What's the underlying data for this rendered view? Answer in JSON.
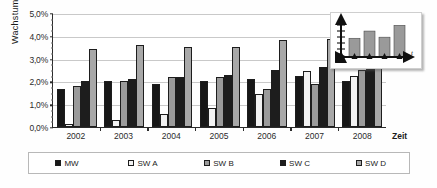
{
  "chart_data": {
    "type": "bar",
    "title": "",
    "xlabel": "Zeit",
    "ylabel": "Wachstum",
    "categories": [
      "2002",
      "2003",
      "2004",
      "2005",
      "2006",
      "2007",
      "2008"
    ],
    "ylim": [
      0,
      5.0
    ],
    "yticks": [
      "0,0%",
      "1,0%",
      "2,0%",
      "3,0%",
      "4,0%",
      "5,0%"
    ],
    "ytick_values": [
      0.0,
      1.0,
      2.0,
      3.0,
      4.0,
      5.0
    ],
    "grid": true,
    "legend_position": "bottom",
    "unit": "%",
    "series": [
      {
        "name": "MW",
        "color": "#171717",
        "values": [
          1.65,
          2.0,
          1.9,
          2.0,
          2.1,
          2.25,
          2.0
        ]
      },
      {
        "name": "SW A",
        "color": "#f2f2f2",
        "values": [
          0.15,
          0.3,
          0.55,
          0.85,
          1.45,
          2.45,
          2.25
        ]
      },
      {
        "name": "SW B",
        "color": "#9b9b9b",
        "values": [
          1.8,
          2.0,
          2.2,
          2.2,
          1.65,
          1.9,
          2.5
        ]
      },
      {
        "name": "SW C",
        "color": "#1d1d1d",
        "values": [
          2.0,
          2.1,
          2.2,
          2.28,
          2.5,
          2.65,
          2.8
        ]
      },
      {
        "name": "SW D",
        "color": "#a8a8a8",
        "values": [
          3.4,
          3.6,
          3.5,
          3.5,
          3.8,
          3.85,
          4.55
        ]
      }
    ]
  },
  "inset": {
    "x_axis_label": "t",
    "bars": [
      0.52,
      0.72,
      0.55,
      0.88
    ]
  }
}
